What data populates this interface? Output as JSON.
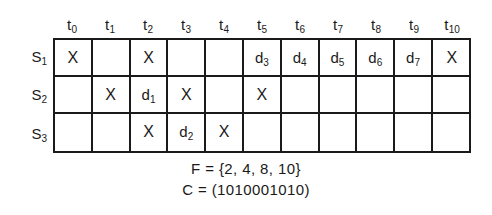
{
  "figure": {
    "type": "schedule-grid",
    "row_label_header": "",
    "columns": [
      {
        "base": "t",
        "sub": "0",
        "label": "t0"
      },
      {
        "base": "t",
        "sub": "1",
        "label": "t1"
      },
      {
        "base": "t",
        "sub": "2",
        "label": "t2"
      },
      {
        "base": "t",
        "sub": "3",
        "label": "t3"
      },
      {
        "base": "t",
        "sub": "4",
        "label": "t4"
      },
      {
        "base": "t",
        "sub": "5",
        "label": "t5"
      },
      {
        "base": "t",
        "sub": "6",
        "label": "t6"
      },
      {
        "base": "t",
        "sub": "7",
        "label": "t7"
      },
      {
        "base": "t",
        "sub": "8",
        "label": "t8"
      },
      {
        "base": "t",
        "sub": "9",
        "label": "t9"
      },
      {
        "base": "t",
        "sub": "10",
        "label": "t10"
      }
    ],
    "rows": [
      {
        "base": "S",
        "sub": "1",
        "label": "S1",
        "cells": [
          {
            "base": "X",
            "sub": "",
            "kind": "mark"
          },
          {
            "base": "",
            "sub": "",
            "kind": "empty"
          },
          {
            "base": "X",
            "sub": "",
            "kind": "mark"
          },
          {
            "base": "",
            "sub": "",
            "kind": "empty"
          },
          {
            "base": "",
            "sub": "",
            "kind": "empty"
          },
          {
            "base": "d",
            "sub": "3",
            "kind": "delay"
          },
          {
            "base": "d",
            "sub": "4",
            "kind": "delay"
          },
          {
            "base": "d",
            "sub": "5",
            "kind": "delay"
          },
          {
            "base": "d",
            "sub": "6",
            "kind": "delay"
          },
          {
            "base": "d",
            "sub": "7",
            "kind": "delay"
          },
          {
            "base": "X",
            "sub": "",
            "kind": "mark"
          }
        ]
      },
      {
        "base": "S",
        "sub": "2",
        "label": "S2",
        "cells": [
          {
            "base": "",
            "sub": "",
            "kind": "empty"
          },
          {
            "base": "X",
            "sub": "",
            "kind": "mark"
          },
          {
            "base": "d",
            "sub": "1",
            "kind": "delay"
          },
          {
            "base": "X",
            "sub": "",
            "kind": "mark"
          },
          {
            "base": "",
            "sub": "",
            "kind": "empty"
          },
          {
            "base": "X",
            "sub": "",
            "kind": "mark"
          },
          {
            "base": "",
            "sub": "",
            "kind": "empty"
          },
          {
            "base": "",
            "sub": "",
            "kind": "empty"
          },
          {
            "base": "",
            "sub": "",
            "kind": "empty"
          },
          {
            "base": "",
            "sub": "",
            "kind": "empty"
          },
          {
            "base": "",
            "sub": "",
            "kind": "empty"
          }
        ]
      },
      {
        "base": "S",
        "sub": "3",
        "label": "S3",
        "cells": [
          {
            "base": "",
            "sub": "",
            "kind": "empty"
          },
          {
            "base": "",
            "sub": "",
            "kind": "empty"
          },
          {
            "base": "X",
            "sub": "",
            "kind": "mark"
          },
          {
            "base": "d",
            "sub": "2",
            "kind": "delay"
          },
          {
            "base": "X",
            "sub": "",
            "kind": "mark"
          },
          {
            "base": "",
            "sub": "",
            "kind": "empty"
          },
          {
            "base": "",
            "sub": "",
            "kind": "empty"
          },
          {
            "base": "",
            "sub": "",
            "kind": "empty"
          },
          {
            "base": "",
            "sub": "",
            "kind": "empty"
          },
          {
            "base": "",
            "sub": "",
            "kind": "empty"
          },
          {
            "base": "",
            "sub": "",
            "kind": "empty"
          }
        ]
      }
    ],
    "formulas": [
      {
        "name": "forbidden-latency-set",
        "text": "F = {2, 4, 8, 10}"
      },
      {
        "name": "collision-vector",
        "text": "C = (1010001010)"
      }
    ],
    "colors": {
      "ink": "#1a1a1a",
      "background": "#ffffff"
    }
  }
}
